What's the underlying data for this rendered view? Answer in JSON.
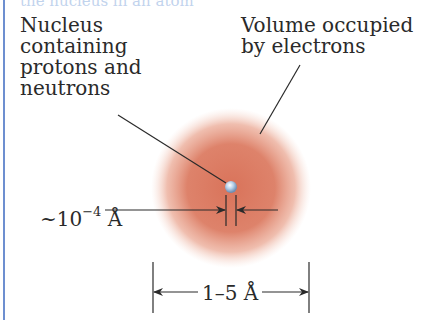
{
  "diagram": {
    "top_caption_partial": "the nucleus in an atom",
    "labels": {
      "nucleus": "Nucleus\ncontaining\nprotons and\nneutrons",
      "volume": "Volume occupied\nby electrons",
      "nucleus_size_prefix": "~10",
      "nucleus_size_exponent": "−4",
      "nucleus_size_unit": " Å",
      "atom_size": "1–5 Å"
    },
    "colors": {
      "cloud": "#d9735a",
      "nucleus": "#a9c6e2",
      "border": "#6d8fd0",
      "line": "#2a2a2a"
    }
  }
}
